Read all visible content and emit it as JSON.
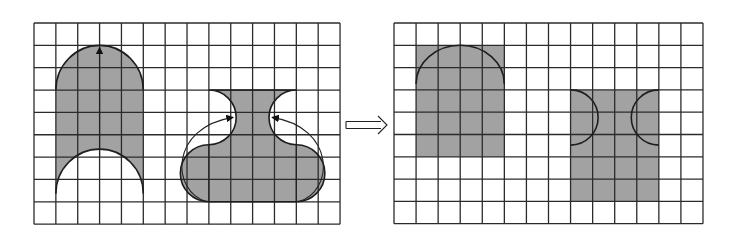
{
  "figure": {
    "colors": {
      "background": "#ffffff",
      "grid_line": "#2b2b2b",
      "shape_fill": "#a2a2a2",
      "outline": "#1e1e1e"
    },
    "left_panel": {
      "grid": {
        "x": 34,
        "y": 23,
        "cols": 14,
        "rows": 9,
        "cell_w": 21.86,
        "cell_h": 22.35
      },
      "shapes": [
        {
          "name": "arch-with-notch",
          "cols": [
            1,
            5
          ],
          "top_arc_center_row": 3,
          "body_bottom_row": 6,
          "notch_center_row": 8,
          "radius_cells": 2,
          "arrow": "vertical upward arrow from notch top to arch apex"
        },
        {
          "name": "vase",
          "cols": [
            8,
            12
          ],
          "top_row": 3,
          "bottom_row": 8,
          "neck_cut_radius_cells": 1.25,
          "body_cap_radius_cells": 1.25,
          "arrows": "two curved arrows moving side caps up into neck cut-outs"
        }
      ]
    },
    "transform_arrow": {
      "symbol": "⟹",
      "label": "double arrow (transforms into)"
    },
    "right_panel": {
      "grid": {
        "x": 394,
        "y": 23,
        "cols": 14,
        "rows": 9,
        "cell_w": 22.07,
        "cell_h": 22.3
      },
      "shapes": [
        {
          "name": "rectangle-from-arch",
          "cols": [
            1,
            5
          ],
          "rows": [
            1,
            6
          ],
          "area_cells": 20,
          "inner_arc": "semicircle outline at top"
        },
        {
          "name": "rectangle-from-vase",
          "cols": [
            8,
            12
          ],
          "rows": [
            3,
            8
          ],
          "area_cells": 20,
          "inner_arcs": "two half-circle outlines on left and right edges"
        }
      ]
    }
  }
}
